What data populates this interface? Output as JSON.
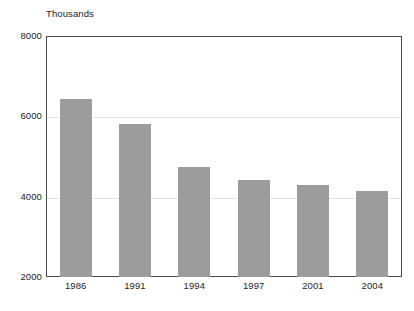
{
  "chart_data": {
    "type": "bar",
    "title": "Thousands",
    "xlabel": "",
    "ylabel": "",
    "categories": [
      "1986",
      "1991",
      "1994",
      "1997",
      "2001",
      "2004"
    ],
    "values": [
      6430,
      5810,
      4740,
      4420,
      4300,
      4130
    ],
    "ylim": [
      2000,
      8000
    ],
    "yticks": [
      "2000",
      "4000",
      "6000",
      "8000"
    ],
    "ytick_values": [
      2000,
      4000,
      6000,
      8000
    ],
    "grid": true,
    "gridlines_at": [
      4000,
      6000
    ],
    "legend": null,
    "legend_position": "none",
    "bar_color": "#9c9c9c",
    "grid_color": "#e2e2e2",
    "axis_color": "#4a4a4a",
    "background_color": "#ffffff"
  }
}
